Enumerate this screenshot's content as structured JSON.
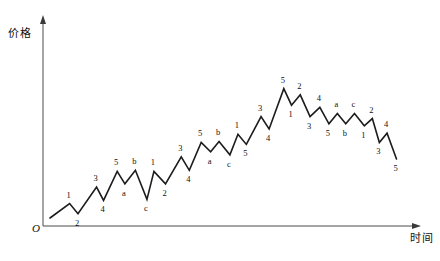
{
  "figure": {
    "origin_label": "O",
    "y_axis_title": "价格",
    "x_axis_title": "时间"
  },
  "chart_data": {
    "type": "line",
    "title": "",
    "subtitle": "",
    "xlabel": "时间",
    "ylabel": "价格",
    "grid": false,
    "legend": "none",
    "axis_arrows": true,
    "xlim": [
      0,
      100
    ],
    "ylim": [
      0,
      100
    ],
    "series": [
      {
        "name": "price",
        "points": [
          {
            "x": 0.0,
            "y": 0.0,
            "label": ""
          },
          {
            "x": 5.6,
            "y": 8.2,
            "label": "1"
          },
          {
            "x": 8.0,
            "y": 2.4,
            "label": "2"
          },
          {
            "x": 13.3,
            "y": 17.6,
            "label": "3"
          },
          {
            "x": 15.3,
            "y": 10.0,
            "label": "4"
          },
          {
            "x": 19.2,
            "y": 26.5,
            "label": "5"
          },
          {
            "x": 21.4,
            "y": 19.4,
            "label": "a"
          },
          {
            "x": 24.4,
            "y": 27.1,
            "label": "b"
          },
          {
            "x": 27.7,
            "y": 10.6,
            "label": "c"
          },
          {
            "x": 29.7,
            "y": 26.5,
            "label": "1"
          },
          {
            "x": 33.0,
            "y": 19.4,
            "label": "2"
          },
          {
            "x": 37.5,
            "y": 34.7,
            "label": "3"
          },
          {
            "x": 39.8,
            "y": 27.1,
            "label": "4"
          },
          {
            "x": 43.2,
            "y": 42.9,
            "label": "5"
          },
          {
            "x": 45.9,
            "y": 37.6,
            "label": "a"
          },
          {
            "x": 48.3,
            "y": 43.5,
            "label": "b"
          },
          {
            "x": 51.4,
            "y": 35.9,
            "label": "c"
          },
          {
            "x": 53.7,
            "y": 47.6,
            "label": "1"
          },
          {
            "x": 56.1,
            "y": 41.8,
            "label": "5"
          },
          {
            "x": 60.3,
            "y": 57.6,
            "label": "3"
          },
          {
            "x": 62.6,
            "y": 50.6,
            "label": "4"
          },
          {
            "x": 66.8,
            "y": 73.5,
            "label": "5"
          },
          {
            "x": 69.0,
            "y": 64.1,
            "label": "1"
          },
          {
            "x": 71.5,
            "y": 70.0,
            "label": "2"
          },
          {
            "x": 74.3,
            "y": 57.6,
            "label": "3"
          },
          {
            "x": 77.1,
            "y": 62.9,
            "label": "4"
          },
          {
            "x": 79.7,
            "y": 53.5,
            "label": "5"
          },
          {
            "x": 82.1,
            "y": 59.4,
            "label": "a"
          },
          {
            "x": 84.5,
            "y": 53.5,
            "label": "b"
          },
          {
            "x": 87.0,
            "y": 59.4,
            "label": "c"
          },
          {
            "x": 89.8,
            "y": 52.4,
            "label": "1"
          },
          {
            "x": 92.1,
            "y": 56.5,
            "label": "2"
          },
          {
            "x": 94.1,
            "y": 42.9,
            "label": "3"
          },
          {
            "x": 96.3,
            "y": 48.2,
            "label": "4"
          },
          {
            "x": 99.0,
            "y": 33.5,
            "label": "5"
          }
        ]
      }
    ]
  }
}
